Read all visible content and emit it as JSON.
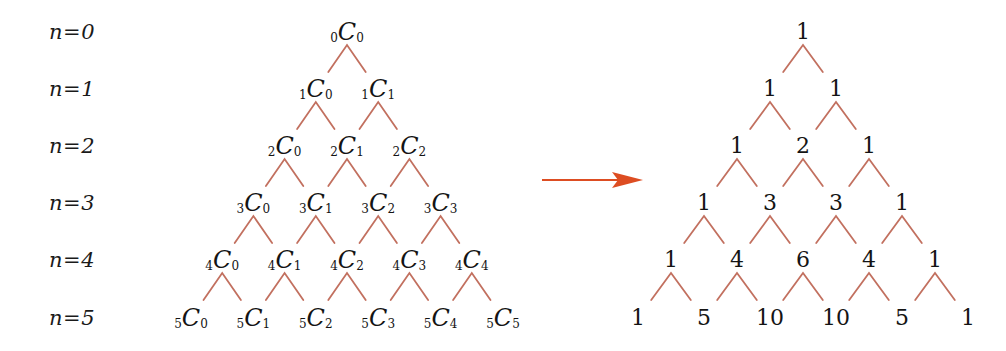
{
  "figure": {
    "line_color": "#c2705f",
    "arrow_color": "#dd4d22",
    "text_color": "#141414",
    "background": "#ffffff"
  },
  "row_labels": [
    {
      "text": "n=0"
    },
    {
      "text": "n=1"
    },
    {
      "text": "n=2"
    },
    {
      "text": "n=3"
    },
    {
      "text": "n=4"
    },
    {
      "text": "n=5"
    }
  ],
  "left_triangle": {
    "name": "combination-triangle",
    "rows": [
      {
        "n": "0",
        "nodes": [
          {
            "pre": "0",
            "cap": "C",
            "post": "0"
          }
        ]
      },
      {
        "n": "1",
        "nodes": [
          {
            "pre": "1",
            "cap": "C",
            "post": "0"
          },
          {
            "pre": "1",
            "cap": "C",
            "post": "1"
          }
        ]
      },
      {
        "n": "2",
        "nodes": [
          {
            "pre": "2",
            "cap": "C",
            "post": "0"
          },
          {
            "pre": "2",
            "cap": "C",
            "post": "1"
          },
          {
            "pre": "2",
            "cap": "C",
            "post": "2"
          }
        ]
      },
      {
        "n": "3",
        "nodes": [
          {
            "pre": "3",
            "cap": "C",
            "post": "0"
          },
          {
            "pre": "3",
            "cap": "C",
            "post": "1"
          },
          {
            "pre": "3",
            "cap": "C",
            "post": "2"
          },
          {
            "pre": "3",
            "cap": "C",
            "post": "3"
          }
        ]
      },
      {
        "n": "4",
        "nodes": [
          {
            "pre": "4",
            "cap": "C",
            "post": "0"
          },
          {
            "pre": "4",
            "cap": "C",
            "post": "1"
          },
          {
            "pre": "4",
            "cap": "C",
            "post": "2"
          },
          {
            "pre": "4",
            "cap": "C",
            "post": "3"
          },
          {
            "pre": "4",
            "cap": "C",
            "post": "4"
          }
        ]
      },
      {
        "n": "5",
        "nodes": [
          {
            "pre": "5",
            "cap": "C",
            "post": "0"
          },
          {
            "pre": "5",
            "cap": "C",
            "post": "1"
          },
          {
            "pre": "5",
            "cap": "C",
            "post": "2"
          },
          {
            "pre": "5",
            "cap": "C",
            "post": "3"
          },
          {
            "pre": "5",
            "cap": "C",
            "post": "4"
          },
          {
            "pre": "5",
            "cap": "C",
            "post": "5"
          }
        ]
      }
    ]
  },
  "right_triangle": {
    "name": "pascal-number-triangle",
    "rows": [
      {
        "n": "0",
        "values": [
          "1"
        ]
      },
      {
        "n": "1",
        "values": [
          "1",
          "1"
        ]
      },
      {
        "n": "2",
        "values": [
          "1",
          "2",
          "1"
        ]
      },
      {
        "n": "3",
        "values": [
          "1",
          "3",
          "3",
          "1"
        ]
      },
      {
        "n": "4",
        "values": [
          "1",
          "4",
          "6",
          "4",
          "1"
        ]
      },
      {
        "n": "5",
        "values": [
          "1",
          "5",
          "10",
          "10",
          "5",
          "1"
        ]
      }
    ]
  },
  "arrow": {
    "name": "rightward-arrow",
    "direction": "right",
    "label": ""
  }
}
